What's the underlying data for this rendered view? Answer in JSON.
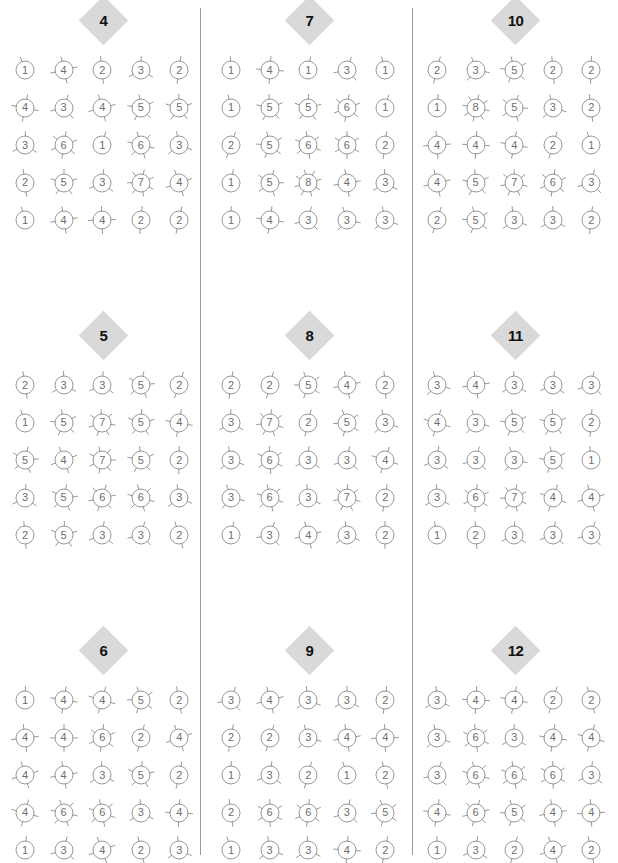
{
  "figure": {
    "glyph_name": "sunburst-number-circle",
    "grid_rows": 5,
    "grid_cols": 5,
    "panel_rows": 3,
    "panel_cols": 3,
    "circle_stroke_color": "#8c8c8c",
    "spoke_stroke_color": "#8c8c8c",
    "badge_fill_color": "#d9d9d9",
    "badge_text_color": "#111111",
    "number_text_color": "#6e6e6e",
    "separator_color": "#9a9a9a",
    "background_color": "#ffffff"
  },
  "separators": [
    {
      "name": "column-separator-1",
      "x": 200
    },
    {
      "name": "column-separator-2",
      "x": 412
    }
  ],
  "panels": [
    {
      "badge": "4",
      "x": 0,
      "y": 0,
      "rows": [
        [
          1,
          4,
          2,
          3,
          2
        ],
        [
          4,
          3,
          4,
          5,
          5
        ],
        [
          3,
          6,
          1,
          6,
          3
        ],
        [
          2,
          5,
          3,
          7,
          4
        ],
        [
          1,
          4,
          4,
          2,
          2
        ]
      ]
    },
    {
      "badge": "7",
      "x": 206,
      "y": 0,
      "rows": [
        [
          1,
          4,
          1,
          3,
          1
        ],
        [
          1,
          5,
          5,
          6,
          1
        ],
        [
          2,
          5,
          6,
          6,
          2
        ],
        [
          1,
          5,
          8,
          4,
          3
        ],
        [
          1,
          4,
          3,
          3,
          3
        ]
      ]
    },
    {
      "badge": "10",
      "x": 412,
      "y": 0,
      "rows": [
        [
          2,
          3,
          5,
          2,
          2
        ],
        [
          1,
          8,
          5,
          3,
          2
        ],
        [
          4,
          4,
          4,
          2,
          1
        ],
        [
          4,
          5,
          7,
          6,
          3
        ],
        [
          2,
          5,
          3,
          3,
          2
        ]
      ]
    },
    {
      "badge": "5",
      "x": 0,
      "y": 315,
      "rows": [
        [
          2,
          3,
          3,
          5,
          2
        ],
        [
          1,
          5,
          7,
          5,
          4
        ],
        [
          5,
          4,
          7,
          5,
          2
        ],
        [
          3,
          5,
          6,
          6,
          3
        ],
        [
          2,
          5,
          3,
          3,
          2
        ]
      ]
    },
    {
      "badge": "8",
      "x": 206,
      "y": 315,
      "rows": [
        [
          2,
          2,
          5,
          4,
          2
        ],
        [
          3,
          7,
          2,
          5,
          3
        ],
        [
          3,
          6,
          3,
          3,
          4
        ],
        [
          3,
          6,
          3,
          7,
          2
        ],
        [
          1,
          3,
          4,
          3,
          2
        ]
      ]
    },
    {
      "badge": "11",
      "x": 412,
      "y": 315,
      "rows": [
        [
          3,
          4,
          3,
          3,
          3
        ],
        [
          4,
          3,
          5,
          5,
          2
        ],
        [
          3,
          3,
          3,
          5,
          1
        ],
        [
          3,
          6,
          7,
          4,
          4
        ],
        [
          1,
          2,
          3,
          3,
          3
        ]
      ]
    },
    {
      "badge": "6",
      "x": 0,
      "y": 630,
      "rows": [
        [
          1,
          4,
          4,
          5,
          2
        ],
        [
          4,
          4,
          6,
          2,
          4
        ],
        [
          4,
          4,
          3,
          5,
          2
        ],
        [
          4,
          6,
          6,
          3,
          4
        ],
        [
          1,
          3,
          4,
          2,
          3
        ]
      ]
    },
    {
      "badge": "9",
      "x": 206,
      "y": 630,
      "rows": [
        [
          3,
          4,
          3,
          3,
          2
        ],
        [
          2,
          2,
          3,
          4,
          4
        ],
        [
          1,
          3,
          2,
          1,
          2
        ],
        [
          2,
          6,
          6,
          3,
          5
        ],
        [
          1,
          3,
          3,
          4,
          2
        ]
      ]
    },
    {
      "badge": "12",
      "x": 412,
      "y": 630,
      "rows": [
        [
          3,
          4,
          4,
          2,
          2
        ],
        [
          3,
          6,
          3,
          4,
          4
        ],
        [
          3,
          6,
          6,
          6,
          3
        ],
        [
          4,
          6,
          5,
          4,
          4
        ],
        [
          1,
          3,
          2,
          4,
          2
        ]
      ]
    }
  ]
}
